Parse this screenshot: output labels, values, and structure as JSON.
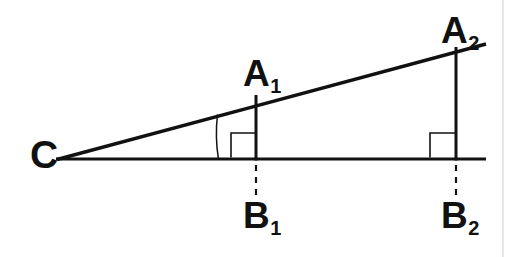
{
  "figure": {
    "kind": "geometry-diagram",
    "background_color": "#ffffff",
    "stroke_color": "#111111",
    "label_color": "#111111",
    "border_line_color": "#cfcfcf",
    "labels": {
      "c": {
        "letter": "C",
        "subscript": ""
      },
      "a1": {
        "letter": "A",
        "subscript": "1"
      },
      "a2": {
        "letter": "A",
        "subscript": "2"
      },
      "b1": {
        "letter": "B",
        "subscript": "1"
      },
      "b2": {
        "letter": "B",
        "subscript": "2"
      }
    },
    "geometry": {
      "apex_c": {
        "x": 56,
        "y": 159
      },
      "baseline": {
        "x1": 56,
        "y1": 159,
        "x2": 486,
        "y2": 159
      },
      "hypotenuse": {
        "x1": 56,
        "y1": 159,
        "x2": 486,
        "y2": 44
      },
      "segment_a1b1": {
        "x": 256,
        "y_top": 96,
        "y_bottom": 160
      },
      "segment_a2b2": {
        "x": 456,
        "y_top": 48,
        "y_bottom": 160
      },
      "right_angle_square_b1": {
        "x": 231,
        "y": 133,
        "size": 25
      },
      "right_angle_square_b2": {
        "x": 430,
        "y": 133,
        "size": 26
      },
      "angle_arc_c": {
        "radius": 162,
        "from_x": 217,
        "from_y": 116,
        "to_x": 218,
        "to_y": 159
      },
      "dashed_drop_b1": {
        "x": 256,
        "y1": 164,
        "y2": 197
      },
      "dashed_drop_b2": {
        "x": 456,
        "y1": 164,
        "y2": 197
      },
      "right_border_line": {
        "x": 503,
        "y1": 0,
        "y2": 257
      }
    },
    "stroke_widths": {
      "main": 3.2,
      "thin": 1.4,
      "dashed": 2.2,
      "border": 1.0
    }
  }
}
